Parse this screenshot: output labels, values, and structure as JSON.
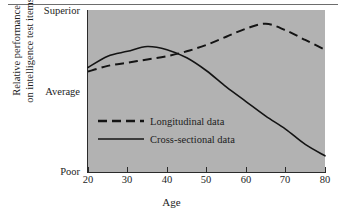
{
  "chart_data": {
    "type": "line",
    "title": "",
    "xlabel": "Age",
    "ylabel_lines": [
      "Relative performance",
      "on intelligence test items"
    ],
    "xlim": [
      20,
      80
    ],
    "xticks": [
      20,
      30,
      40,
      50,
      60,
      70,
      80
    ],
    "xtick_labels": [
      "20",
      "30",
      "40",
      "50",
      "60",
      "70",
      "80"
    ],
    "ytick_labels": [
      "Superior",
      "Average",
      "Poor"
    ],
    "ytick_positions": [
      1.0,
      0.38,
      0.0
    ],
    "ylim_labels": [
      "Poor",
      "Superior"
    ],
    "grid": false,
    "legend_position": "inside-left-middle",
    "plot_background": "#b2b2b2",
    "line_color": "#1a1a1a",
    "series": [
      {
        "name": "Longitudinal data",
        "style": "dashed",
        "x": [
          20,
          25,
          30,
          35,
          40,
          45,
          50,
          55,
          60,
          65,
          70,
          75,
          80
        ],
        "y": [
          0.62,
          0.655,
          0.675,
          0.695,
          0.715,
          0.745,
          0.785,
          0.835,
          0.885,
          0.915,
          0.875,
          0.815,
          0.755
        ]
      },
      {
        "name": "Cross-sectional data",
        "style": "solid",
        "x": [
          20,
          25,
          30,
          35,
          40,
          45,
          50,
          55,
          60,
          65,
          70,
          75,
          80
        ],
        "y": [
          0.645,
          0.715,
          0.745,
          0.775,
          0.755,
          0.705,
          0.625,
          0.525,
          0.435,
          0.345,
          0.265,
          0.17,
          0.1
        ]
      }
    ],
    "annotations": {
      "crossover_age": 43,
      "cross_sectional_peak_age": 37,
      "longitudinal_peak_age": 65
    }
  },
  "axis": {
    "x_title": "Age",
    "y_title_line1": "Relative performance",
    "y_title_line2": "on intelligence test items",
    "y_top_label": "Superior",
    "y_mid_label": "Average",
    "y_bottom_label": "Poor",
    "x_labels": [
      "20",
      "30",
      "40",
      "50",
      "60",
      "70",
      "80"
    ]
  },
  "legend": {
    "items": [
      {
        "label": "Longitudinal data",
        "style": "dashed"
      },
      {
        "label": "Cross-sectional data",
        "style": "solid"
      }
    ]
  }
}
